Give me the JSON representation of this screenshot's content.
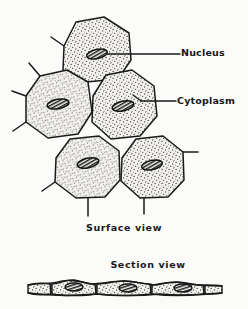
{
  "figure": {
    "title_implicit": "Squamous epithelial cells",
    "background_color": "#fbfbfa",
    "ink_color": "#1a1a1a",
    "cytoplasm_fill": "#efeeea",
    "nucleus_fill": "#2b2b2b",
    "labels": {
      "nucleus": "Nucleus",
      "cytoplasm": "Cytoplasm"
    },
    "captions": {
      "surface": "Surface view",
      "section": "Section view"
    },
    "surface_view": {
      "cell_count": 5,
      "nucleus_count": 5,
      "cells": [
        {
          "name": "cell-top",
          "polygon": "64,46 76,22 104,17 129,33 131,60 118,79 86,82 63,70",
          "nucleus": {
            "cx": 97,
            "cy": 54,
            "rx": 10.5,
            "ry": 4.6,
            "rot": -12
          },
          "spikes": [
            "64,46 52,38"
          ]
        },
        {
          "name": "cell-left",
          "polygon": "26,96 40,76 67,70 88,82 92,112 78,134 48,138 26,122",
          "nucleus": {
            "cx": 58,
            "cy": 104,
            "rx": 11,
            "ry": 4.8,
            "rot": -10
          },
          "spikes": [
            "40,76 29,64",
            "26,122 13,130",
            "26,96 12,92"
          ]
        },
        {
          "name": "cell-center",
          "polygon": "93,96 106,75 132,70 154,86 157,116 140,136 111,139 92,122",
          "nucleus": {
            "cx": 123,
            "cy": 106,
            "rx": 11,
            "ry": 4.8,
            "rot": -12
          },
          "spikes": []
        },
        {
          "name": "cell-bottom-left",
          "polygon": "56,158 70,139 99,136 119,151 120,180 105,197 76,198 55,182",
          "nucleus": {
            "cx": 88,
            "cy": 163,
            "rx": 11,
            "ry": 4.8,
            "rot": -12
          },
          "spikes": [
            "55,182 42,190",
            "88,198 88,215"
          ]
        },
        {
          "name": "cell-bottom-right",
          "polygon": "122,158 136,139 163,136 183,152 184,180 168,197 140,198 121,181",
          "nucleus": {
            "cx": 152,
            "cy": 165,
            "rx": 10.5,
            "ry": 4.6,
            "rot": -12
          },
          "spikes": [
            "183,152 197,152",
            "144,198 144,213"
          ]
        }
      ],
      "leader_lines": [
        {
          "name": "leader-nucleus",
          "from": [
            108,
            54
          ],
          "to": [
            180,
            54
          ]
        },
        {
          "name": "leader-cytoplasm",
          "from": [
            141,
            101
          ],
          "to": [
            176,
            101
          ]
        }
      ]
    },
    "section_view": {
      "cell_count": 6,
      "nucleus_count": 3,
      "x_start": 28,
      "x_end": 222,
      "baseline_y": 290,
      "nuclei": [
        {
          "cx": 74,
          "cy": 287,
          "rx": 9,
          "ry": 4
        },
        {
          "cx": 128,
          "cy": 288,
          "rx": 9,
          "ry": 4
        },
        {
          "cx": 183,
          "cy": 288,
          "rx": 9,
          "ry": 4
        }
      ]
    }
  }
}
